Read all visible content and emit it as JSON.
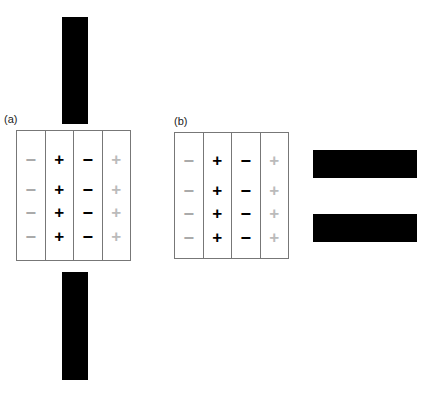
{
  "panels": [
    {
      "label": "(a)",
      "bars": "vertical-top-bottom"
    },
    {
      "label": "(b)",
      "bars": "horizontal-right"
    }
  ],
  "grid": {
    "columns": [
      {
        "symbol": "−",
        "color": "#aaaaaa"
      },
      {
        "symbol": "+",
        "color": "#000000"
      },
      {
        "symbol": "−",
        "color": "#000000"
      },
      {
        "symbol": "+",
        "color": "#bbbbbb"
      }
    ],
    "rows": 4
  },
  "caption": "(cropped caption text, unreadable)"
}
